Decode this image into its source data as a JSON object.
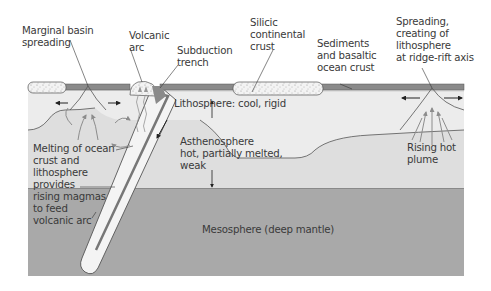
{
  "diagram": {
    "type": "cross-section",
    "colors": {
      "background": "#ffffff",
      "lithosphere": "#ededed",
      "asthenosphere": "#dcdcdc",
      "mesosphere": "#a9a9a9",
      "ocean_crust": "#8a8a8a",
      "continental_crust": "#f2f2f2",
      "slab": "#f4f4f4",
      "outline": "#4a4a4a",
      "arrow": "#8c8c8c",
      "text": "#3a3a3a"
    }
  },
  "labels": {
    "marginal_basin": "Marginal basin\nspreading",
    "volcanic_arc": "Volcanic\narc",
    "subduction_trench": "Subduction\ntrench",
    "silicic_crust": "Silicic\ncontinental\ncrust",
    "sediments": "Sediments\nand basaltic\nocean crust",
    "spreading": "Spreading,\ncreating of\nlithosphere\nat ridge-rift axis",
    "lithosphere": "Lithosphere: cool, rigid",
    "asthenosphere": "Asthenosphere\nhot, partially melted,\nweak",
    "melting": "Melting of ocean\ncrust and\nlithosphere\nprovides\nrising magmas\nto feed\nvolcanic arc",
    "rising_plume": "Rising hot\nplume",
    "mesosphere": "Mesosphere (deep mantle)"
  }
}
